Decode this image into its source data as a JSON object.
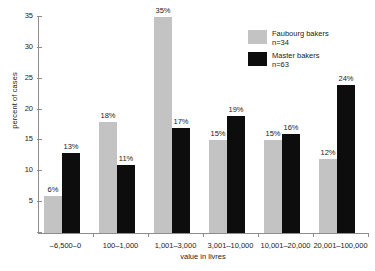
{
  "chart_data": {
    "type": "bar",
    "title": "",
    "xlabel": "value in livres",
    "ylabel": "percent of cases",
    "categories": [
      "–6,500–0",
      "100–1,000",
      "1,001–3,000",
      "3,001–10,000",
      "10,001–20,000",
      "20,001–100,000"
    ],
    "ylim": [
      0,
      35
    ],
    "yticks": [
      0,
      5,
      10,
      15,
      20,
      25,
      30,
      35
    ],
    "ytick_labels": [
      "",
      "5",
      "10",
      "15",
      "20",
      "25",
      "30",
      "35"
    ],
    "grid": false,
    "legend_position": "top-right",
    "series": [
      {
        "name": "Faubourg bakers",
        "n_label": "n=34",
        "color": "#c3c3c3",
        "values": [
          6,
          18,
          35,
          15,
          15,
          12
        ],
        "value_labels": [
          "6%",
          "18%",
          "35%",
          "15%",
          "15%",
          "12%"
        ]
      },
      {
        "name": "Master bakers",
        "n_label": "n=63",
        "color": "#0d0d0d",
        "values": [
          13,
          11,
          17,
          19,
          16,
          24
        ],
        "value_labels": [
          "13%",
          "11%",
          "17%",
          "19%",
          "16%",
          "24%"
        ]
      }
    ]
  }
}
